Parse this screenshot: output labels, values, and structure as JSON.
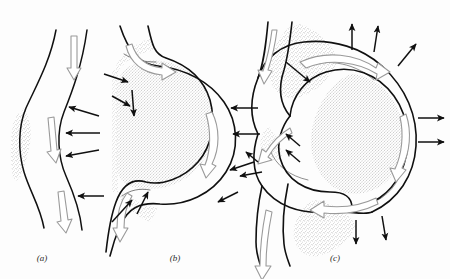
{
  "figure": {
    "background_color": "#fdfdfd",
    "ink_color": "#111111",
    "stipple_color": "#8a8a8a",
    "flow_arrow_color": "#9a9a9a",
    "panels": [
      {
        "id": "a",
        "label": "(a)",
        "caption": "Slightly sinuous channel with incipient bank attack",
        "flow_arrows": 3,
        "erosion_arrows": 3,
        "stipple_regions": 1
      },
      {
        "id": "b",
        "label": "(b)",
        "caption": "Well developed meander loop with point bars",
        "flow_arrows": 3,
        "erosion_arrows": 9,
        "stipple_regions": 2
      },
      {
        "id": "c",
        "label": "(c)",
        "caption": "Compound meander loop approaching neck cutoff",
        "flow_arrows": 6,
        "erosion_arrows": 12,
        "stipple_regions": 4
      }
    ]
  },
  "labels": {
    "a": "(a)",
    "b": "(b)",
    "c": "(c)"
  },
  "legend_semantics": {
    "hollow_arrow": "channel flow direction",
    "solid_arrow": "direction of bank erosion / lateral migration",
    "stippled_area": "point bar and floodplain deposits"
  }
}
